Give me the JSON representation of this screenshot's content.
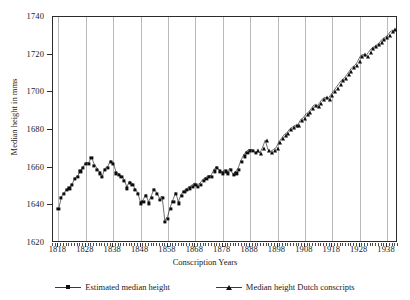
{
  "chart_data": {
    "type": "scatter",
    "title": "",
    "xlabel": "Conscription Years",
    "ylabel": "Median height in mms",
    "xlim": [
      1816,
      1942
    ],
    "ylim": [
      1620,
      1740
    ],
    "grid": "vertical gridlines at each labeled decade tick",
    "legend_position": "bottom-center",
    "xticks": [
      1818,
      1828,
      1838,
      1848,
      1858,
      1868,
      1878,
      1888,
      1898,
      1908,
      1918,
      1928,
      1938
    ],
    "yticks": [
      1620,
      1640,
      1660,
      1680,
      1700,
      1720,
      1740
    ],
    "series": [
      {
        "name": "Estimated median height",
        "marker": "square",
        "x": [
          1818,
          1819,
          1820,
          1821,
          1822,
          1823,
          1824,
          1825,
          1826,
          1827,
          1828,
          1829,
          1830,
          1831,
          1832,
          1833,
          1834,
          1835,
          1836,
          1837,
          1838,
          1839,
          1840,
          1841,
          1842,
          1843,
          1844,
          1845,
          1846,
          1847,
          1848,
          1849,
          1850,
          1851,
          1852,
          1853,
          1854,
          1855,
          1856,
          1857,
          1858,
          1859,
          1860,
          1861,
          1862,
          1863,
          1864,
          1865,
          1866,
          1867,
          1868,
          1869,
          1870,
          1871,
          1872,
          1873,
          1874,
          1875,
          1876,
          1877,
          1878,
          1879,
          1880,
          1881,
          1882,
          1883,
          1884,
          1885,
          1886,
          1887,
          1888,
          1889,
          1890
        ],
        "values": [
          1638,
          1644,
          1646,
          1648,
          1649,
          1651,
          1654,
          1655,
          1658,
          1660,
          1662,
          1662,
          1665,
          1661,
          1659,
          1657,
          1655,
          1659,
          1660,
          1663,
          1662,
          1657,
          1656,
          1655,
          1653,
          1649,
          1652,
          1651,
          1648,
          1646,
          1641,
          1642,
          1645,
          1641,
          1644,
          1648,
          1646,
          1643,
          1644,
          1631,
          1633,
          1638,
          1642,
          1646,
          1641,
          1645,
          1647,
          1648,
          1649,
          1650,
          1651,
          1650,
          1651,
          1653,
          1654,
          1655,
          1655,
          1658,
          1660,
          1658,
          1657,
          1658,
          1657,
          1659,
          1656,
          1657,
          1659,
          1663,
          1666,
          1668,
          1669,
          1669,
          1668
        ]
      },
      {
        "name": "Median height Dutch conscripts",
        "marker": "triangle",
        "x": [
          1891,
          1892,
          1893,
          1894,
          1895,
          1896,
          1897,
          1898,
          1899,
          1900,
          1901,
          1902,
          1903,
          1904,
          1905,
          1906,
          1907,
          1908,
          1909,
          1910,
          1911,
          1912,
          1913,
          1914,
          1915,
          1916,
          1917,
          1918,
          1919,
          1920,
          1921,
          1922,
          1923,
          1924,
          1925,
          1926,
          1927,
          1928,
          1929,
          1930,
          1931,
          1932,
          1933,
          1934,
          1935,
          1936,
          1937,
          1938,
          1939,
          1940,
          1941
        ],
        "values": [
          1669,
          1667,
          1670,
          1674,
          1669,
          1668,
          1669,
          1670,
          1673,
          1675,
          1677,
          1678,
          1680,
          1681,
          1682,
          1682,
          1685,
          1686,
          1688,
          1689,
          1691,
          1693,
          1692,
          1694,
          1696,
          1697,
          1696,
          1698,
          1700,
          1702,
          1704,
          1706,
          1707,
          1709,
          1711,
          1713,
          1714,
          1716,
          1719,
          1720,
          1719,
          1721,
          1723,
          1724,
          1725,
          1726,
          1728,
          1729,
          1730,
          1732,
          1733
        ]
      }
    ]
  },
  "legend": {
    "entries": [
      {
        "label": "Estimated median height",
        "marker": "square-marker"
      },
      {
        "label": "Median height Dutch conscripts",
        "marker": "triangle-marker"
      }
    ]
  },
  "colors": {
    "marker": "#0d0d0d",
    "gridline": "#b9b9b9",
    "frame": "#2b2b2b",
    "background": "#ffffff"
  }
}
